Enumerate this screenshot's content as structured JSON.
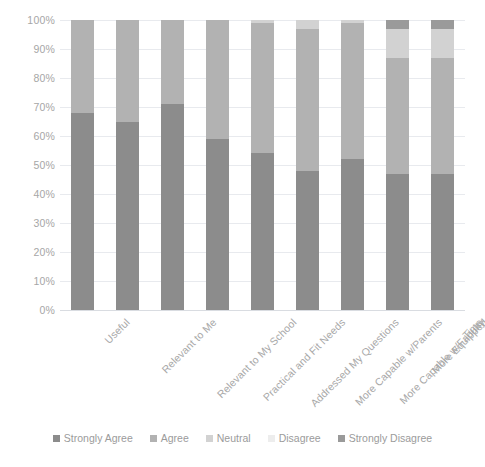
{
  "chart_data": {
    "type": "bar",
    "subtype": "stacked-bar-100-percent",
    "title": "",
    "subtitle": "",
    "xlabel": "",
    "ylabel": "",
    "ylim": [
      0,
      100
    ],
    "ytick_labels": [
      "100%",
      "90%",
      "80%",
      "70%",
      "60%",
      "50%",
      "40%",
      "30%",
      "20%",
      "10%",
      "0%"
    ],
    "ytick_values": [
      100,
      90,
      80,
      70,
      60,
      50,
      40,
      30,
      20,
      10,
      0
    ],
    "grid": true,
    "legend_position": "bottom",
    "categories": [
      "Useful",
      "Relevant to Me",
      "Relevant to My School",
      "Practical and Fit Needs",
      "Addressed My Questions",
      "More Capable w/Parents",
      "More Capable w/Faculty",
      "More Equipped",
      "Time"
    ],
    "series": [
      {
        "name": "Strongly Agree",
        "color": "#8c8c8c",
        "values": [
          68,
          65,
          71,
          59,
          54,
          48,
          52,
          47,
          47
        ]
      },
      {
        "name": "Agree",
        "color": "#b2b2b2",
        "values": [
          32,
          35,
          29,
          41,
          45,
          49,
          47,
          40,
          40
        ]
      },
      {
        "name": "Neutral",
        "color": "#d2d2d2",
        "values": [
          0,
          0,
          0,
          0,
          1,
          3,
          1,
          10,
          10
        ]
      },
      {
        "name": "Disagree",
        "color": "#ededed",
        "values": [
          0,
          0,
          0,
          0,
          0,
          0,
          0,
          0,
          0
        ]
      },
      {
        "name": "Strongly Disagree",
        "color": "#9a9a9a",
        "values": [
          0,
          0,
          0,
          0,
          0,
          0,
          0,
          3,
          3
        ]
      }
    ]
  },
  "legend": {
    "items": [
      {
        "label": "Strongly Agree",
        "color": "#8c8c8c"
      },
      {
        "label": "Agree",
        "color": "#b2b2b2"
      },
      {
        "label": "Neutral",
        "color": "#d2d2d2"
      },
      {
        "label": "Disagree",
        "color": "#ededed"
      },
      {
        "label": "Strongly Disagree",
        "color": "#9a9a9a"
      }
    ]
  },
  "style": {
    "gridline_color": "#e8eaee",
    "tick_label_color": "#a6a6a6",
    "background": "#ffffff"
  }
}
